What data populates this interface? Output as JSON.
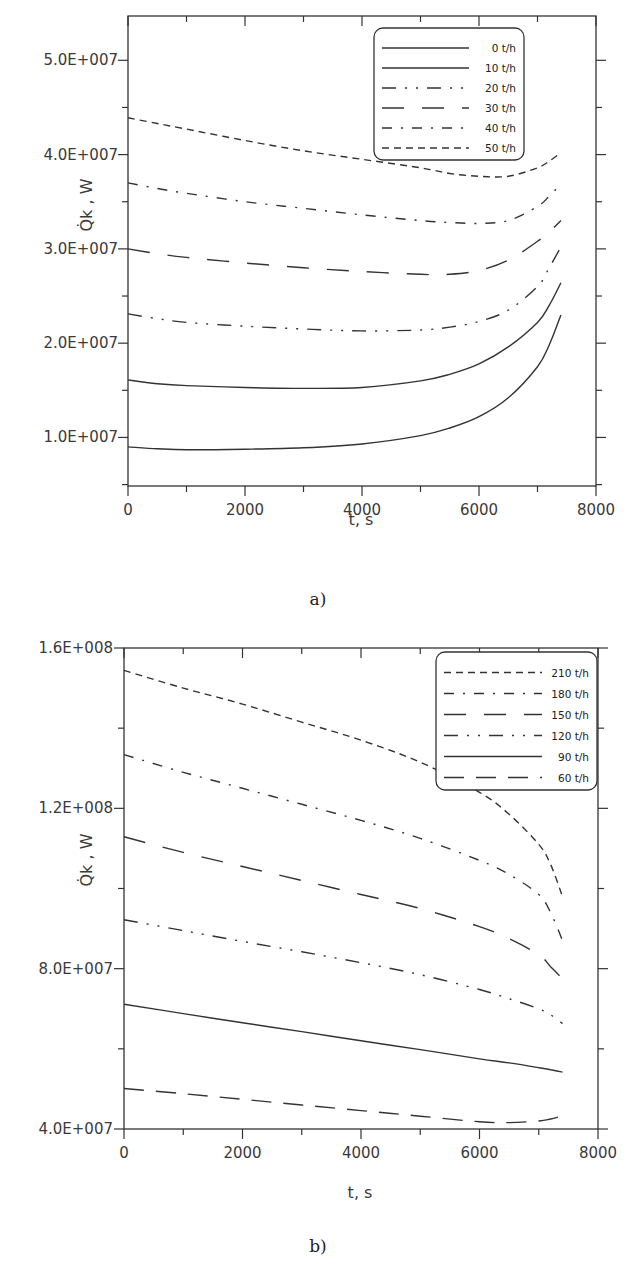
{
  "chart_data": [
    {
      "id": "a",
      "type": "line",
      "caption": "a)",
      "title": "",
      "xlabel": "t, s",
      "ylabel": "Q̇k , W",
      "xlim": [
        0,
        8000
      ],
      "ylim": [
        4850000.0,
        54700000.0
      ],
      "xticks": [
        0,
        2000,
        4000,
        6000,
        8000
      ],
      "xtick_labels": [
        "0",
        "2000",
        "4000",
        "6000",
        "8000"
      ],
      "yticks": [
        10000000.0,
        20000000.0,
        30000000.0,
        40000000.0,
        50000000.0
      ],
      "ytick_labels": [
        "1.0E+007",
        "2.0E+007",
        "3.0E+007",
        "4.0E+007",
        "5.0E+007"
      ],
      "grid": false,
      "legend_position": "upper right",
      "series": [
        {
          "name": "0 t/h",
          "dash": "solid",
          "x": [
            0,
            500,
            1000,
            2000,
            3000,
            4000,
            5000,
            5500,
            6000,
            6500,
            7000,
            7200,
            7400
          ],
          "values": [
            9000000.0,
            8800000.0,
            8700000.0,
            8750000.0,
            8900000.0,
            9300000.0,
            10200000.0,
            11000000.0,
            12200000.0,
            14200000.0,
            17500000.0,
            19800000.0,
            23000000.0
          ]
        },
        {
          "name": "10 t/h",
          "dash": "solid",
          "x": [
            0,
            500,
            1000,
            2000,
            3000,
            4000,
            5000,
            5500,
            6000,
            6500,
            7000,
            7200,
            7400
          ],
          "values": [
            16100000.0,
            15700000.0,
            15500000.0,
            15300000.0,
            15200000.0,
            15300000.0,
            16000000.0,
            16700000.0,
            17800000.0,
            19600000.0,
            22200000.0,
            24000000.0,
            26400000.0
          ]
        },
        {
          "name": "20 t/h",
          "dash": "dash-dot-dot",
          "x": [
            0,
            500,
            1000,
            2000,
            3000,
            4000,
            5000,
            5500,
            6000,
            6500,
            7000,
            7200,
            7400
          ],
          "values": [
            23100000.0,
            22600000.0,
            22200000.0,
            21800000.0,
            21500000.0,
            21300000.0,
            21400000.0,
            21700000.0,
            22300000.0,
            23500000.0,
            26000000.0,
            28000000.0,
            30200000.0
          ]
        },
        {
          "name": "30 t/h",
          "dash": "long-gap",
          "x": [
            0,
            500,
            1000,
            2000,
            3000,
            4000,
            5000,
            5500,
            6000,
            6500,
            7000,
            7200,
            7400
          ],
          "values": [
            30000000.0,
            29500000.0,
            29100000.0,
            28500000.0,
            28000000.0,
            27600000.0,
            27300000.0,
            27300000.0,
            27700000.0,
            28800000.0,
            30800000.0,
            31800000.0,
            33000000.0
          ]
        },
        {
          "name": "40 t/h",
          "dash": "dash-dot",
          "x": [
            0,
            500,
            1000,
            2000,
            3000,
            4000,
            5000,
            5500,
            6000,
            6500,
            7000,
            7200,
            7400
          ],
          "values": [
            37000000.0,
            36400000.0,
            35900000.0,
            35000000.0,
            34300000.0,
            33600000.0,
            33000000.0,
            32800000.0,
            32700000.0,
            33000000.0,
            34500000.0,
            35600000.0,
            36900000.0
          ]
        },
        {
          "name": "50 t/h",
          "dash": "dashed",
          "x": [
            0,
            500,
            1000,
            2000,
            3000,
            4000,
            5000,
            5500,
            6000,
            6500,
            7000,
            7200,
            7400
          ],
          "values": [
            43900000.0,
            43300000.0,
            42700000.0,
            41500000.0,
            40400000.0,
            39500000.0,
            38600000.0,
            38000000.0,
            37700000.0,
            37700000.0,
            38600000.0,
            39300000.0,
            40200000.0
          ]
        }
      ]
    },
    {
      "id": "b",
      "type": "line",
      "caption": "b)",
      "title": "",
      "xlabel": "t, s",
      "ylabel": "Q̇k , W",
      "xlim": [
        0,
        8000
      ],
      "ylim": [
        40000000.0,
        160000000.0
      ],
      "xticks": [
        0,
        2000,
        4000,
        6000,
        8000
      ],
      "xtick_labels": [
        "0",
        "2000",
        "4000",
        "6000",
        "8000"
      ],
      "yticks": [
        40000000.0,
        80000000.0,
        120000000.0,
        160000000.0
      ],
      "ytick_labels": [
        "4.0E+007",
        "8.0E+007",
        "1.2E+008",
        "1.6E+008"
      ],
      "grid": false,
      "legend_position": "upper right",
      "series": [
        {
          "name": "210 t/h",
          "dash": "dashed",
          "x": [
            0,
            1000,
            2000,
            3000,
            4000,
            5000,
            6000,
            6500,
            7000,
            7200,
            7400
          ],
          "values": [
            154400000.0,
            150000000.0,
            146000000.0,
            141500000.0,
            137000000.0,
            131500000.0,
            124000000.0,
            118500000.0,
            111000000.0,
            106000000.0,
            98000000.0
          ]
        },
        {
          "name": "180 t/h",
          "dash": "dash-dot",
          "x": [
            0,
            1000,
            2000,
            3000,
            4000,
            5000,
            6000,
            6500,
            7000,
            7200,
            7400
          ],
          "values": [
            133400000.0,
            129000000.0,
            125000000.0,
            121000000.0,
            117000000.0,
            112500000.0,
            107000000.0,
            103500000.0,
            98500000.0,
            94000000.0,
            87000000.0
          ]
        },
        {
          "name": "150 t/h",
          "dash": "long-gap",
          "x": [
            0,
            1000,
            2000,
            3000,
            4000,
            5000,
            6000,
            6500,
            7000,
            7200,
            7400
          ],
          "values": [
            112900000.0,
            109000000.0,
            105500000.0,
            102000000.0,
            98500000.0,
            95000000.0,
            90500000.0,
            87500000.0,
            83500000.0,
            80500000.0,
            77500000.0
          ]
        },
        {
          "name": "120 t/h",
          "dash": "dash-dot-dot",
          "x": [
            0,
            1000,
            2000,
            3000,
            4000,
            5000,
            6000,
            6500,
            7000,
            7200,
            7400
          ],
          "values": [
            92200000.0,
            89500000.0,
            86800000.0,
            84200000.0,
            81500000.0,
            78500000.0,
            74800000.0,
            72500000.0,
            70000000.0,
            68500000.0,
            66300000.0
          ]
        },
        {
          "name": "90 t/h",
          "dash": "solid",
          "x": [
            0,
            1000,
            2000,
            3000,
            4000,
            5000,
            6000,
            6500,
            7000,
            7200,
            7400
          ],
          "values": [
            71100000.0,
            68800000.0,
            66500000.0,
            64300000.0,
            62000000.0,
            59800000.0,
            57500000.0,
            56500000.0,
            55300000.0,
            54800000.0,
            54200000.0
          ]
        },
        {
          "name": "60 t/h",
          "dash": "long-dash",
          "x": [
            0,
            1000,
            2000,
            3000,
            4000,
            5000,
            6000,
            6500,
            7000,
            7200,
            7400
          ],
          "values": [
            50100000.0,
            48800000.0,
            47400000.0,
            46000000.0,
            44600000.0,
            43200000.0,
            41800000.0,
            41600000.0,
            42000000.0,
            42500000.0,
            43300000.0
          ]
        }
      ]
    }
  ],
  "colors": {
    "line": "#333333",
    "axis": "#333333",
    "background": "#ffffff",
    "text": "#3a3a3a"
  }
}
